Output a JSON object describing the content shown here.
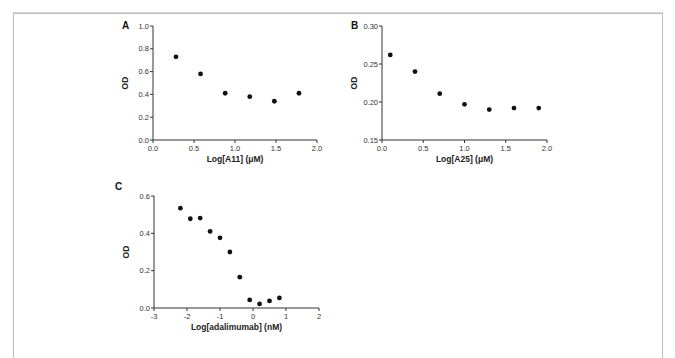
{
  "figure": {
    "border_color": "#bdbdbd",
    "point_color": "#111111"
  },
  "chart_data": [
    {
      "panel": "A",
      "type": "scatter",
      "title": "",
      "xlabel": "Log[A11] (μM)",
      "ylabel": "OD",
      "xlim": [
        0.0,
        2.0
      ],
      "ylim": [
        0.0,
        1.0
      ],
      "xticks": [
        0.0,
        0.5,
        1.0,
        1.5,
        2.0
      ],
      "xtick_labels": [
        "0.0",
        "0.5",
        "1.0",
        "1.5",
        "2.0"
      ],
      "yticks": [
        0.0,
        0.2,
        0.4,
        0.6,
        0.8,
        1.0
      ],
      "ytick_labels": [
        "0.0",
        "0.2",
        "0.4",
        "0.6",
        "0.8",
        "1.0"
      ],
      "grid": false,
      "legend": null,
      "x": [
        0.28,
        0.58,
        0.88,
        1.18,
        1.48,
        1.78
      ],
      "y": [
        0.73,
        0.58,
        0.41,
        0.38,
        0.34,
        0.41
      ],
      "layout": {
        "x0": 153,
        "x1": 317,
        "y0": 140,
        "y1": 26
      }
    },
    {
      "panel": "B",
      "type": "scatter",
      "title": "",
      "xlabel": "Log[A25] (μM)",
      "ylabel": "OD",
      "xlim": [
        0.0,
        2.0
      ],
      "ylim": [
        0.15,
        0.3
      ],
      "xticks": [
        0.0,
        0.5,
        1.0,
        1.5,
        2.0
      ],
      "xtick_labels": [
        "0.0",
        "0.5",
        "1.0",
        "1.5",
        "2.0"
      ],
      "yticks": [
        0.15,
        0.2,
        0.25,
        0.3
      ],
      "ytick_labels": [
        "0.15",
        "0.20",
        "0.25",
        "0.30"
      ],
      "grid": false,
      "legend": null,
      "x": [
        0.1,
        0.4,
        0.7,
        1.0,
        1.3,
        1.6,
        1.9
      ],
      "y": [
        0.262,
        0.24,
        0.211,
        0.197,
        0.19,
        0.192,
        0.192
      ],
      "layout": {
        "x0": 382,
        "x1": 547,
        "y0": 140,
        "y1": 26
      }
    },
    {
      "panel": "C",
      "type": "scatter",
      "title": "",
      "xlabel": "Log[adalimumab] (nM)",
      "ylabel": "OD",
      "xlim": [
        -3,
        2
      ],
      "ylim": [
        0.0,
        0.6
      ],
      "xticks": [
        -3,
        -2,
        -1,
        0,
        1,
        2
      ],
      "xtick_labels": [
        "-3",
        "-2",
        "-1",
        "0",
        "1",
        "2"
      ],
      "yticks": [
        0.0,
        0.2,
        0.4,
        0.6
      ],
      "ytick_labels": [
        "0.0",
        "0.2",
        "0.4",
        "0.6"
      ],
      "grid": false,
      "legend": null,
      "x": [
        -2.2,
        -1.9,
        -1.6,
        -1.3,
        -1.0,
        -0.7,
        -0.4,
        -0.1,
        0.2,
        0.5,
        0.8
      ],
      "y": [
        0.535,
        0.478,
        0.482,
        0.41,
        0.376,
        0.3,
        0.165,
        0.043,
        0.022,
        0.038,
        0.054
      ],
      "layout": {
        "x0": 154,
        "x1": 319,
        "y0": 308,
        "y1": 196
      }
    }
  ]
}
